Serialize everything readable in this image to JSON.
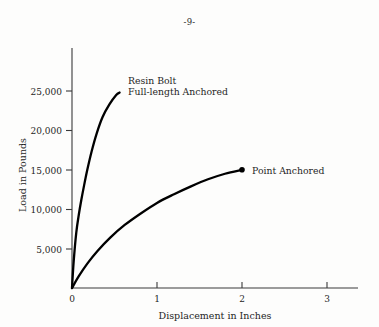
{
  "page": {
    "number_label": "-9-"
  },
  "chart_data": {
    "type": "line",
    "title": "",
    "xlabel": "Displacement in Inches",
    "ylabel": "Load in Pounds",
    "xlim": [
      0,
      3.4
    ],
    "ylim": [
      0,
      30000
    ],
    "xticks": [
      0,
      1,
      2,
      3
    ],
    "xtick_labels": [
      "0",
      "1",
      "2",
      "3"
    ],
    "yticks": [
      5000,
      10000,
      15000,
      20000,
      25000
    ],
    "ytick_labels": [
      "5,000",
      "10,000",
      "15,000",
      "20,000",
      "25,000"
    ],
    "grid": false,
    "legend_position": "inline-annotations",
    "line_color": "#000000",
    "axis_color": "#3a3a3a",
    "series": [
      {
        "name": "Resin Bolt Full-length Anchored",
        "label_line1": "Resin Bolt",
        "label_line2": "Full-length Anchored",
        "end_marker": false,
        "x": [
          0.0,
          0.02,
          0.05,
          0.08,
          0.11,
          0.14,
          0.18,
          0.23,
          0.29,
          0.36,
          0.44,
          0.52,
          0.56
        ],
        "y": [
          0,
          3400,
          7000,
          9300,
          11200,
          12900,
          15000,
          17300,
          19600,
          21700,
          23300,
          24500,
          24800
        ]
      },
      {
        "name": "Point Anchored",
        "label_line1": "Point Anchored",
        "label_line2": "",
        "end_marker": true,
        "x": [
          0.0,
          0.08,
          0.18,
          0.3,
          0.45,
          0.62,
          0.8,
          1.0,
          1.2,
          1.4,
          1.6,
          1.8,
          2.0
        ],
        "y": [
          0,
          1500,
          3100,
          4700,
          6400,
          8000,
          9400,
          10800,
          11900,
          12900,
          13800,
          14500,
          15000
        ]
      }
    ],
    "annotations": [
      {
        "text": "Resin Bolt",
        "x": 0.66,
        "y": 26200
      },
      {
        "text": "Full-length Anchored",
        "x": 0.66,
        "y": 24800
      },
      {
        "text": "Point Anchored",
        "x": 2.12,
        "y": 15000
      }
    ]
  }
}
